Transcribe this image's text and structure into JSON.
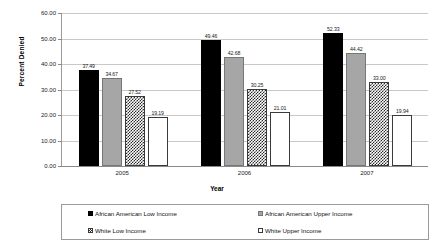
{
  "chart_data": {
    "type": "bar",
    "title": "",
    "xlabel": "Year",
    "ylabel": "Percent Denied",
    "categories": [
      "2005",
      "2006",
      "2007"
    ],
    "ylim": [
      0,
      60
    ],
    "ytick_labels": [
      "60.00",
      "50.00",
      "40.00",
      "30.00",
      "20.00",
      "10.00",
      "0.00"
    ],
    "ytick_values": [
      60,
      50,
      40,
      30,
      20,
      10,
      0
    ],
    "grid": true,
    "legend_position": "bottom",
    "series": [
      {
        "name": "African American Low Income",
        "values": [
          37.49,
          49.46,
          52.33
        ],
        "labels": [
          "37.49",
          "49.46",
          "52.33"
        ],
        "color": "#000000",
        "swatch": "solid-black"
      },
      {
        "name": "African American Upper Income",
        "values": [
          34.67,
          42.68,
          44.42
        ],
        "labels": [
          "34.67",
          "42.68",
          "44.42"
        ],
        "color": "#a6a6a6",
        "swatch": "solid-gray"
      },
      {
        "name": "White Low Income",
        "values": [
          27.52,
          30.25,
          33.0
        ],
        "labels": [
          "27.52",
          "30.25",
          "33.00"
        ],
        "color": "#2b2b2b",
        "swatch": "checkered"
      },
      {
        "name": "White Upper Income",
        "values": [
          19.19,
          21.01,
          19.94
        ],
        "labels": [
          "19.19",
          "21.01",
          "19.94"
        ],
        "color": "#ffffff",
        "swatch": "outline-white"
      }
    ]
  }
}
